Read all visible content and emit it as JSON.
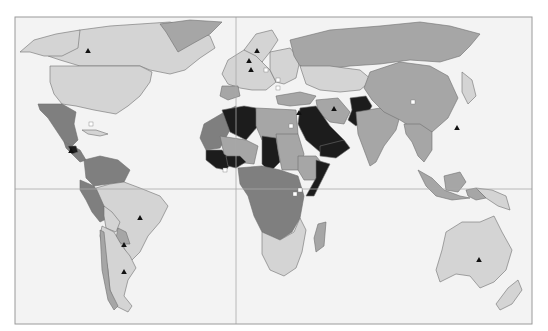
{
  "map": {
    "type": "choropleth",
    "projection": "equirectangular-like world map",
    "frame": {
      "x": 15,
      "y": 17,
      "width": 517,
      "height": 307
    },
    "graticule": {
      "equator_y": 189,
      "prime_meridian_x": 236
    },
    "colors": {
      "background": "#ffffff",
      "ocean": "#f3f3f3",
      "frame": "#9a9a9a",
      "graticule": "#a8a8a8",
      "class_1": "#d4d4d4",
      "class_2": "#a6a6a6",
      "class_3": "#7f7f7f",
      "class_4": "#1c1c1c",
      "border": "#5a5a5a"
    },
    "legend": [],
    "regions": [
      {
        "name": "canada",
        "class": 1,
        "points": "40,47 60,40 80,30 110,26 140,24 170,22 190,28 210,36 215,48 200,58 185,70 170,74 150,70 140,66 80,66 60,60 48,56"
      },
      {
        "name": "alaska",
        "class": 1,
        "points": "20,52 34,40 56,34 80,30 78,48 62,56 44,56 30,52"
      },
      {
        "name": "greenland",
        "class": 2,
        "points": "160,24 190,20 222,22 210,34 192,44 178,52 172,42 166,32"
      },
      {
        "name": "usa",
        "class": 1,
        "points": "50,66 80,66 140,66 152,72 150,82 140,96 128,106 116,114 94,110 76,106 62,104 54,94 50,82"
      },
      {
        "name": "mexico",
        "class": 3,
        "points": "38,104 62,104 76,112 74,124 78,140 72,146 64,142 56,130 48,118 40,110"
      },
      {
        "name": "central-america",
        "class": 3,
        "points": "64,142 72,146 80,150 86,160 80,162 72,154 66,148"
      },
      {
        "name": "honduras-guatemala",
        "class": 4,
        "points": "68,146 76,146 78,152 72,154"
      },
      {
        "name": "cuba-caribbean",
        "class": 1,
        "points": "82,130 96,130 108,134 100,136 88,134"
      },
      {
        "name": "colombia-venezuela",
        "class": 3,
        "points": "84,160 100,156 118,160 130,170 124,182 108,184 94,186 86,178"
      },
      {
        "name": "peru-ecuador",
        "class": 3,
        "points": "80,180 94,186 104,200 108,218 100,222 92,212 86,200 80,190"
      },
      {
        "name": "brazil",
        "class": 1,
        "points": "96,188 110,184 124,182 140,188 160,196 168,206 160,222 148,236 140,252 130,262 124,248 120,232 112,222 104,206"
      },
      {
        "name": "bolivia",
        "class": 1,
        "points": "104,206 112,212 120,222 116,232 106,228 104,216"
      },
      {
        "name": "paraguay",
        "class": 2,
        "points": "118,228 126,232 130,244 122,244 116,238"
      },
      {
        "name": "argentina-chile",
        "class": 1,
        "points": "102,226 114,232 122,246 130,256 136,268 128,280 124,296 132,306 128,312 116,306 110,290 108,270 104,250 100,236"
      },
      {
        "name": "chile-strip",
        "class": 2,
        "points": "100,230 104,232 110,290 118,306 114,310 108,300 102,270"
      },
      {
        "name": "europe-west",
        "class": 1,
        "points": "228,60 244,50 256,44 266,50 262,62 270,70 276,82 266,90 252,90 240,88 228,84 222,74"
      },
      {
        "name": "scandinavia",
        "class": 1,
        "points": "244,50 256,34 272,30 278,40 270,52 262,62 256,56"
      },
      {
        "name": "iberia",
        "class": 2,
        "points": "222,86 238,86 240,96 228,100 220,96"
      },
      {
        "name": "eastern-europe",
        "class": 1,
        "points": "270,52 290,48 300,60 296,78 284,84 276,82 270,70"
      },
      {
        "name": "russia",
        "class": 2,
        "points": "290,40 330,30 380,26 420,22 450,26 480,34 470,46 460,56 440,62 410,60 380,64 350,66 320,70 300,66 294,56"
      },
      {
        "name": "kazakhstan-central-asia",
        "class": 1,
        "points": "300,66 330,66 360,70 372,80 360,90 340,92 320,90 306,84"
      },
      {
        "name": "turkey",
        "class": 2,
        "points": "276,96 300,92 316,96 310,104 290,106 278,104"
      },
      {
        "name": "iran",
        "class": 2,
        "points": "316,100 338,98 350,112 344,124 330,122 318,112"
      },
      {
        "name": "saudi-arabia-gulf",
        "class": 4,
        "points": "300,108 316,106 330,126 344,140 338,148 320,152 306,140 298,124"
      },
      {
        "name": "yemen-oman",
        "class": 4,
        "points": "320,146 344,140 350,148 336,158 320,156"
      },
      {
        "name": "pakistan-afghanistan",
        "class": 4,
        "points": "350,98 366,96 372,106 364,120 356,126 348,120 352,110"
      },
      {
        "name": "india",
        "class": 2,
        "points": "356,112 380,108 400,116 396,130 384,146 376,162 370,166 364,150 358,134"
      },
      {
        "name": "china-mongolia",
        "class": 2,
        "points": "370,72 400,62 430,66 448,76 458,98 448,118 432,132 416,130 400,120 384,112 372,100 364,88"
      },
      {
        "name": "southeast-asia",
        "class": 2,
        "points": "404,124 420,124 432,132 432,150 424,162 418,156 412,142 406,134"
      },
      {
        "name": "japan",
        "class": 1,
        "points": "462,72 472,80 476,96 468,104 462,92"
      },
      {
        "name": "sumatra-java",
        "class": 2,
        "points": "418,170 432,178 444,190 460,196 470,198 452,200 436,196 426,186"
      },
      {
        "name": "borneo",
        "class": 2,
        "points": "444,176 460,172 466,182 458,192 446,190"
      },
      {
        "name": "new-guinea",
        "class": 1,
        "points": "476,188 492,190 506,196 510,210 498,206 486,198"
      },
      {
        "name": "new-guinea-west",
        "class": 2,
        "points": "466,190 476,188 486,198 476,200 468,196"
      },
      {
        "name": "australia",
        "class": 1,
        "points": "446,232 462,222 480,222 494,216 502,232 512,250 506,270 494,282 480,288 470,276 456,274 440,282 436,270 442,250"
      },
      {
        "name": "new-zealand",
        "class": 1,
        "points": "508,288 518,280 522,290 512,304 500,310 496,304"
      },
      {
        "name": "north-africa-west",
        "class": 3,
        "points": "204,124 228,110 236,106 230,130 220,148 206,150 200,138"
      },
      {
        "name": "algeria",
        "class": 4,
        "points": "222,110 244,106 256,108 258,126 246,140 230,132"
      },
      {
        "name": "libya-egypt",
        "class": 2,
        "points": "256,108 296,110 298,134 286,140 262,140 256,126"
      },
      {
        "name": "west-africa-coast",
        "class": 4,
        "points": "206,150 222,150 232,162 226,170 216,168 206,160"
      },
      {
        "name": "sahel",
        "class": 2,
        "points": "220,136 246,140 258,146 254,164 236,162 224,154"
      },
      {
        "name": "mali-burkina",
        "class": 4,
        "points": "226,156 240,156 246,162 236,168 228,166"
      },
      {
        "name": "chad",
        "class": 4,
        "points": "262,136 276,138 280,162 270,172 262,164"
      },
      {
        "name": "sudan",
        "class": 2,
        "points": "276,134 298,134 304,154 300,170 282,170 278,150"
      },
      {
        "name": "ethiopia-somalia",
        "class": 2,
        "points": "298,156 316,156 326,168 316,180 304,180 298,170"
      },
      {
        "name": "somalia",
        "class": 4,
        "points": "316,160 330,164 322,180 314,196 306,196 316,178"
      },
      {
        "name": "central-africa",
        "class": 3,
        "points": "238,168 262,166 280,170 298,176 304,196 300,218 292,232 280,240 262,232 254,216 248,196 240,184"
      },
      {
        "name": "southern-africa",
        "class": 1,
        "points": "262,232 280,240 294,232 300,218 306,230 302,252 296,268 284,276 270,270 262,254"
      },
      {
        "name": "madagascar",
        "class": 2,
        "points": "318,224 326,222 324,246 316,252 314,238"
      }
    ],
    "markers": [
      {
        "name": "canada",
        "shape": "triangle",
        "fill": "#111111",
        "x": 88,
        "y": 51
      },
      {
        "name": "sweden",
        "shape": "triangle",
        "fill": "#111111",
        "x": 257,
        "y": 51
      },
      {
        "name": "uk-netherlands",
        "shape": "triangle",
        "fill": "#111111",
        "x": 249,
        "y": 61
      },
      {
        "name": "germany",
        "shape": "triangle",
        "fill": "#111111",
        "x": 251,
        "y": 70
      },
      {
        "name": "poland",
        "shape": "square",
        "fill": "#ffffff",
        "x": 266,
        "y": 70
      },
      {
        "name": "hungary",
        "shape": "square",
        "fill": "#ffffff",
        "x": 278,
        "y": 80
      },
      {
        "name": "balkans",
        "shape": "square",
        "fill": "#ffffff",
        "x": 278,
        "y": 88
      },
      {
        "name": "honduras",
        "shape": "triangle",
        "fill": "#111111",
        "x": 71,
        "y": 151
      },
      {
        "name": "cuba",
        "shape": "square",
        "fill": "#ffffff",
        "x": 91,
        "y": 124
      },
      {
        "name": "brazil",
        "shape": "triangle",
        "fill": "#111111",
        "x": 140,
        "y": 218
      },
      {
        "name": "paraguay",
        "shape": "triangle",
        "fill": "#111111",
        "x": 124,
        "y": 245
      },
      {
        "name": "argentina",
        "shape": "triangle",
        "fill": "#111111",
        "x": 124,
        "y": 272
      },
      {
        "name": "egypt",
        "shape": "square",
        "fill": "#ffffff",
        "x": 291,
        "y": 126
      },
      {
        "name": "israel",
        "shape": "triangle",
        "fill": "#111111",
        "x": 299,
        "y": 113
      },
      {
        "name": "iran",
        "shape": "triangle",
        "fill": "#111111",
        "x": 334,
        "y": 109
      },
      {
        "name": "china",
        "shape": "square",
        "fill": "#ffffff",
        "x": 413,
        "y": 102
      },
      {
        "name": "philippines-taiwan",
        "shape": "triangle",
        "fill": "#111111",
        "x": 457,
        "y": 128
      },
      {
        "name": "ivory-coast",
        "shape": "square",
        "fill": "#ffffff",
        "x": 225,
        "y": 170
      },
      {
        "name": "uganda",
        "shape": "square",
        "fill": "#ffffff",
        "x": 300,
        "y": 190
      },
      {
        "name": "rwanda",
        "shape": "square",
        "fill": "#ffffff",
        "x": 295,
        "y": 194
      },
      {
        "name": "australia",
        "shape": "triangle",
        "fill": "#111111",
        "x": 479,
        "y": 260
      }
    ]
  }
}
